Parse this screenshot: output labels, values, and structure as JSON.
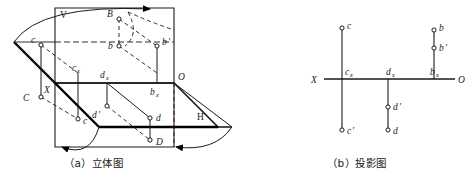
{
  "figure": {
    "title_a": "（a）立体图",
    "title_b": "（b）投影图",
    "stroke_color": "#1a1a1a",
    "bold_stroke_color": "#000000"
  },
  "solid_view": {
    "plane_labels": {
      "v_plane": "V",
      "h_plane": "H",
      "origin": "O",
      "axis_x": "X"
    },
    "points": [
      {
        "id": "B",
        "label": "B",
        "sub": "",
        "prime": ""
      },
      {
        "id": "b",
        "label": "b",
        "sub": "",
        "prime": ""
      },
      {
        "id": "bp",
        "label": "b",
        "sub": "",
        "prime": "′"
      },
      {
        "id": "bx",
        "label": "b",
        "sub": "x",
        "prime": ""
      },
      {
        "id": "C",
        "label": "C",
        "sub": "",
        "prime": ""
      },
      {
        "id": "c",
        "label": "c",
        "sub": "",
        "prime": ""
      },
      {
        "id": "cp",
        "label": "c",
        "sub": "",
        "prime": "′"
      },
      {
        "id": "cx",
        "label": "c",
        "sub": "x",
        "prime": ""
      },
      {
        "id": "D",
        "label": "D",
        "sub": "",
        "prime": ""
      },
      {
        "id": "d",
        "label": "d",
        "sub": "",
        "prime": ""
      },
      {
        "id": "dp",
        "label": "d",
        "sub": "",
        "prime": "′"
      },
      {
        "id": "dx",
        "label": "d",
        "sub": "x",
        "prime": ""
      }
    ]
  },
  "projection_view": {
    "axis_left_label": "X",
    "axis_right_label": "O",
    "points": [
      {
        "id": "c",
        "label": "c",
        "sub": "",
        "prime": ""
      },
      {
        "id": "cx",
        "label": "c",
        "sub": "x",
        "prime": ""
      },
      {
        "id": "cp",
        "label": "c",
        "sub": "",
        "prime": "′"
      },
      {
        "id": "dx",
        "label": "d",
        "sub": "x",
        "prime": ""
      },
      {
        "id": "dp",
        "label": "d",
        "sub": "",
        "prime": "′"
      },
      {
        "id": "d",
        "label": "d",
        "sub": "",
        "prime": ""
      },
      {
        "id": "b",
        "label": "b",
        "sub": "",
        "prime": ""
      },
      {
        "id": "bp",
        "label": "b",
        "sub": "",
        "prime": "′"
      },
      {
        "id": "bx",
        "label": "b",
        "sub": "x",
        "prime": ""
      }
    ]
  }
}
